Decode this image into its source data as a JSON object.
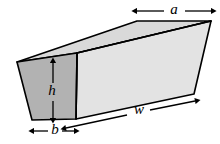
{
  "figure": {
    "name": "trapezoidal-prism-diagram",
    "background_color": "#ffffff",
    "stroke_color": "#000000",
    "colors": {
      "left_face_fill": "#b2b2b2",
      "top_face_fill": "#d9d9d9",
      "front_face_fill": "#e3e3e3",
      "outline": "#000000",
      "label": "#000000"
    },
    "faces": [
      {
        "name": "left-trapezoid-face",
        "fill": "#b2b2b2",
        "points": "17,62 77,53 76,119 32,120"
      },
      {
        "name": "top-parallelogram-face",
        "fill": "#d9d9d9",
        "points": "17,62 77,53 211,21 137,21"
      },
      {
        "name": "front-face",
        "fill": "#e3e3e3",
        "points": "77,53 211,21 194,94 76,119"
      }
    ],
    "edges": [
      {
        "name": "edge-top-left-back",
        "x1": 17,
        "y1": 62,
        "x2": 137,
        "y2": 21
      },
      {
        "name": "edge-top-back",
        "x1": 137,
        "y1": 21,
        "x2": 211,
        "y2": 21
      },
      {
        "name": "edge-top-front",
        "x1": 77,
        "y1": 53,
        "x2": 211,
        "y2": 21
      },
      {
        "name": "edge-top-left-front",
        "x1": 17,
        "y1": 62,
        "x2": 77,
        "y2": 53
      },
      {
        "name": "edge-left-front-vertical",
        "x1": 77,
        "y1": 53,
        "x2": 76,
        "y2": 119
      },
      {
        "name": "edge-left-back-slant",
        "x1": 17,
        "y1": 62,
        "x2": 32,
        "y2": 120
      },
      {
        "name": "edge-bottom-left",
        "x1": 32,
        "y1": 120,
        "x2": 76,
        "y2": 119
      },
      {
        "name": "edge-bottom-front",
        "x1": 76,
        "y1": 119,
        "x2": 194,
        "y2": 94
      },
      {
        "name": "edge-right-vertical",
        "x1": 211,
        "y1": 21,
        "x2": 194,
        "y2": 94
      }
    ],
    "dimensions": [
      {
        "name": "dimension-a",
        "label": "a",
        "orientation": "horizontal",
        "arrow": {
          "x1": 137,
          "y1": 11,
          "x2": 211,
          "y2": 11
        },
        "label_pos": {
          "x": 174,
          "y": 10
        },
        "measures": "top-back-edge-length"
      },
      {
        "name": "dimension-h",
        "label": "h",
        "orientation": "vertical",
        "arrow": {
          "x1": 53,
          "y1": 63,
          "x2": 53,
          "y2": 118
        },
        "label_pos": {
          "x": 52,
          "y": 92
        },
        "measures": "trapezoid-height"
      },
      {
        "name": "dimension-b",
        "label": "b",
        "orientation": "horizontal",
        "arrow": {
          "x1": 34,
          "y1": 131,
          "x2": 74,
          "y2": 131
        },
        "label_pos": {
          "x": 55,
          "y": 130
        },
        "measures": "trapezoid-bottom-width"
      },
      {
        "name": "dimension-w",
        "label": "w",
        "orientation": "diagonal",
        "arrow": {
          "x1": 66,
          "y1": 128,
          "x2": 195,
          "y2": 101
        },
        "label_pos": {
          "x": 140,
          "y": 110
        },
        "measures": "prism-length"
      }
    ]
  }
}
